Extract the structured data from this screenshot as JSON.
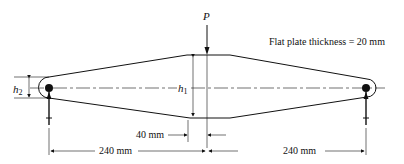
{
  "diagram": {
    "type": "engineering-free-body",
    "note": "Flat plate thickness = 20 mm",
    "load": {
      "label": "P",
      "direction": "down"
    },
    "dimensions": {
      "h1": {
        "symbol": "h",
        "subscript": "1"
      },
      "h2": {
        "symbol": "h",
        "subscript": "2"
      },
      "flat_length": "40 mm",
      "left_span": "240 mm",
      "right_span": "240 mm"
    },
    "supports": [
      {
        "name": "left-pin",
        "reaction": "up"
      },
      {
        "name": "right-pin",
        "reaction": "up"
      }
    ],
    "colors": {
      "line": "#111111",
      "background": "#ffffff"
    }
  }
}
